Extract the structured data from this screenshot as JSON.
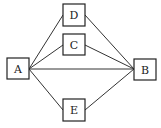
{
  "diagram": {
    "type": "graph",
    "nodes": [
      {
        "id": "A",
        "label": "A",
        "x": 7,
        "y": 58,
        "w": 22,
        "h": 21
      },
      {
        "id": "D",
        "label": "D",
        "x": 63,
        "y": 4,
        "w": 22,
        "h": 22
      },
      {
        "id": "C",
        "label": "C",
        "x": 63,
        "y": 34,
        "w": 22,
        "h": 21
      },
      {
        "id": "B",
        "label": "B",
        "x": 134,
        "y": 59,
        "w": 22,
        "h": 21
      },
      {
        "id": "E",
        "label": "E",
        "x": 63,
        "y": 99,
        "w": 22,
        "h": 22
      }
    ],
    "edges": [
      {
        "from": "A",
        "to": "D"
      },
      {
        "from": "A",
        "to": "C"
      },
      {
        "from": "A",
        "to": "B"
      },
      {
        "from": "A",
        "to": "E"
      },
      {
        "from": "D",
        "to": "B"
      },
      {
        "from": "C",
        "to": "B"
      },
      {
        "from": "E",
        "to": "B"
      }
    ]
  }
}
